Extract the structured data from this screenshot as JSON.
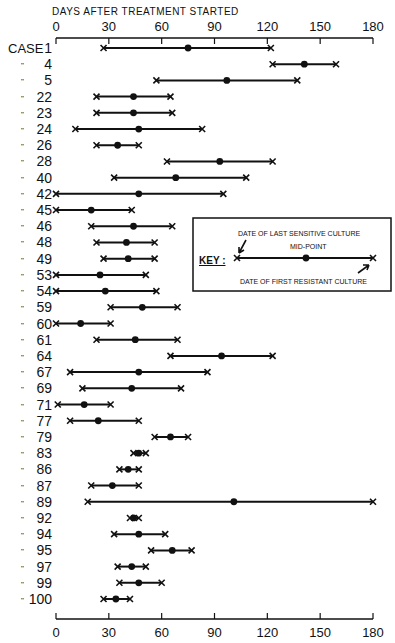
{
  "chart_data": {
    "type": "range",
    "title": "DAYS AFTER TREATMENT STARTED",
    "xlabel": "DAYS AFTER TREATMENT STARTED",
    "ylabel": "CASE",
    "xlim": [
      0,
      180
    ],
    "xticks": [
      0,
      30,
      60,
      90,
      120,
      150,
      180
    ],
    "case_prefix": "CASE",
    "ditto_mark": "\"",
    "series": [
      {
        "case": "1",
        "start": 27,
        "mid": 75,
        "end": 122
      },
      {
        "case": "4",
        "start": 123,
        "mid": 141,
        "end": 159
      },
      {
        "case": "5",
        "start": 57,
        "mid": 97,
        "end": 137
      },
      {
        "case": "22",
        "start": 23,
        "mid": 44,
        "end": 65
      },
      {
        "case": "23",
        "start": 23,
        "mid": 44,
        "end": 66
      },
      {
        "case": "24",
        "start": 11,
        "mid": 47,
        "end": 83
      },
      {
        "case": "26",
        "start": 23,
        "mid": 35,
        "end": 47
      },
      {
        "case": "28",
        "start": 63,
        "mid": 93,
        "end": 123
      },
      {
        "case": "40",
        "start": 33,
        "mid": 68,
        "end": 108
      },
      {
        "case": "42",
        "start": 0,
        "mid": 47,
        "end": 95
      },
      {
        "case": "45",
        "start": 0,
        "mid": 20,
        "end": 43
      },
      {
        "case": "46",
        "start": 20,
        "mid": 44,
        "end": 66
      },
      {
        "case": "48",
        "start": 23,
        "mid": 40,
        "end": 56
      },
      {
        "case": "49",
        "start": 27,
        "mid": 41,
        "end": 56
      },
      {
        "case": "53",
        "start": 0,
        "mid": 25,
        "end": 51
      },
      {
        "case": "54",
        "start": 0,
        "mid": 28,
        "end": 57
      },
      {
        "case": "59",
        "start": 31,
        "mid": 49,
        "end": 69
      },
      {
        "case": "60",
        "start": 0,
        "mid": 14,
        "end": 31
      },
      {
        "case": "61",
        "start": 23,
        "mid": 45,
        "end": 69
      },
      {
        "case": "64",
        "start": 65,
        "mid": 94,
        "end": 123
      },
      {
        "case": "67",
        "start": 8,
        "mid": 47,
        "end": 86
      },
      {
        "case": "69",
        "start": 15,
        "mid": 43,
        "end": 71
      },
      {
        "case": "71",
        "start": 1,
        "mid": 16,
        "end": 31
      },
      {
        "case": "77",
        "start": 8,
        "mid": 24,
        "end": 47
      },
      {
        "case": "79",
        "start": 56,
        "mid": 65,
        "end": 75
      },
      {
        "case": "83",
        "start": 44,
        "mid": 47,
        "end": 51
      },
      {
        "case": "86",
        "start": 36,
        "mid": 41,
        "end": 47
      },
      {
        "case": "87",
        "start": 20,
        "mid": 32,
        "end": 47
      },
      {
        "case": "89",
        "start": 18,
        "mid": 101,
        "end": 180
      },
      {
        "case": "92",
        "start": 42,
        "mid": 44,
        "end": 47
      },
      {
        "case": "94",
        "start": 33,
        "mid": 47,
        "end": 62
      },
      {
        "case": "95",
        "start": 54,
        "mid": 66,
        "end": 77
      },
      {
        "case": "97",
        "start": 35,
        "mid": 43,
        "end": 51
      },
      {
        "case": "99",
        "start": 36,
        "mid": 47,
        "end": 60
      },
      {
        "case": "100",
        "start": 27,
        "mid": 34,
        "end": 42
      }
    ],
    "legend": {
      "key_label": "KEY :",
      "start_label": "DATE OF LAST SENSITIVE CULTURE",
      "mid_label": "MID-POINT",
      "end_label": "DATE OF FIRST RESISTANT CULTURE"
    }
  }
}
